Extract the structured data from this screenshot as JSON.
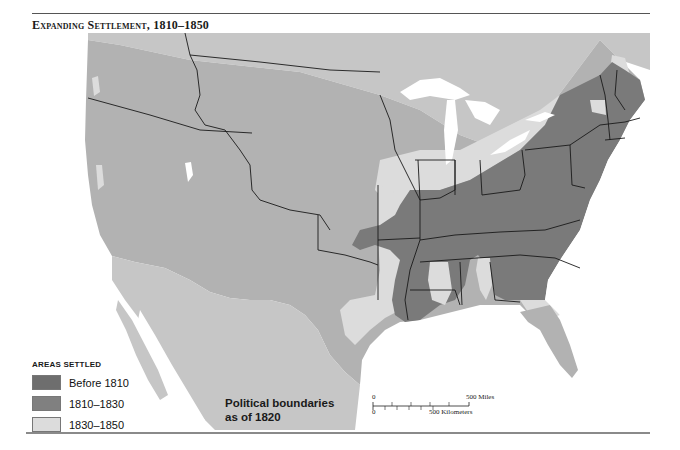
{
  "title": "Expanding Settlement, 1810–1850",
  "legend": {
    "heading": "AREAS SETTLED",
    "items": [
      {
        "label": "Before 1810",
        "color": "#6e6e6e"
      },
      {
        "label": "1810–1830",
        "color": "#808080"
      },
      {
        "label": "1830–1850",
        "color": "#dcdcdc"
      }
    ]
  },
  "annotation": {
    "line1": "Political boundaries",
    "line2": "as of 1820"
  },
  "scale": {
    "zero_miles": "0",
    "zero_km": "0",
    "miles_label": "500 Miles",
    "km_label": "500 Kilometers"
  },
  "colors": {
    "unsettled": "#b2b2b2",
    "foreign_territory": "#c6c6c6",
    "settled_early": "#6e6e6e",
    "settled_1810_1830": "#808080",
    "settled_1830_1850": "#dcdcdc",
    "water": "#ffffff",
    "boundary": "#1a1a1a"
  }
}
